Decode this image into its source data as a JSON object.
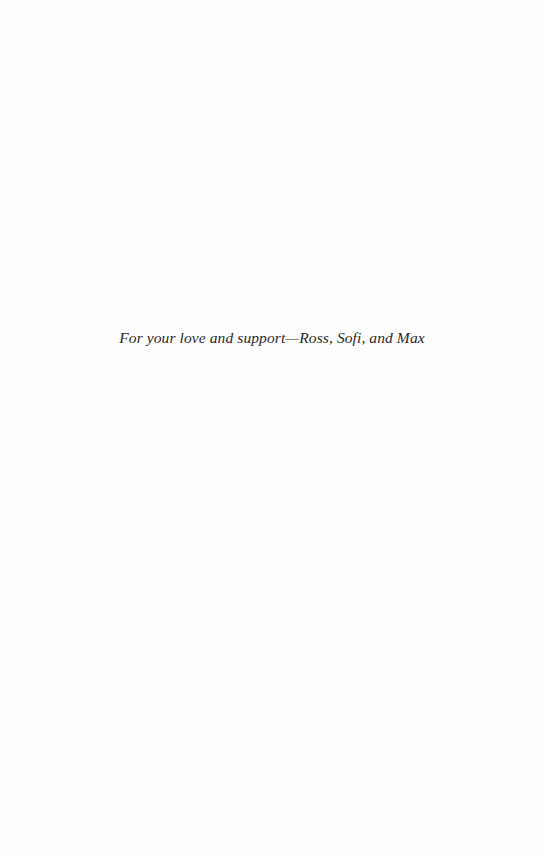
{
  "page": {
    "dedication": "For your love and support—Ross, Sofi, and Max"
  }
}
